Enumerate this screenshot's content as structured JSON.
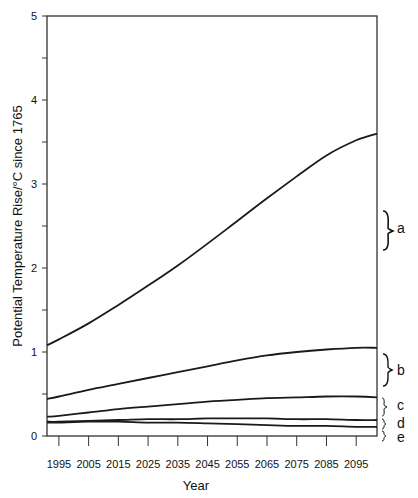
{
  "chart_data": {
    "type": "line",
    "title": "",
    "xlabel": "Year",
    "ylabel": "Potential Temperature Rise/°C since 1765",
    "xlim": [
      1991,
      2102
    ],
    "ylim": [
      0,
      5
    ],
    "yticks": [
      "0",
      "1",
      "2",
      "3",
      "4",
      "5"
    ],
    "xticks": [
      "1995",
      "2005",
      "2015",
      "2025",
      "2035",
      "2045",
      "2055",
      "2065",
      "2075",
      "2085",
      "2095"
    ],
    "grid": false,
    "legend": "right-side brace labels",
    "x": [
      1991,
      1995,
      2005,
      2015,
      2025,
      2035,
      2045,
      2055,
      2065,
      2075,
      2085,
      2095,
      2102
    ],
    "series": [
      {
        "name": "a",
        "values": [
          1.08,
          1.15,
          1.34,
          1.56,
          1.79,
          2.03,
          2.29,
          2.56,
          2.83,
          3.09,
          3.34,
          3.52,
          3.6
        ]
      },
      {
        "name": "b",
        "values": [
          0.44,
          0.47,
          0.55,
          0.62,
          0.69,
          0.76,
          0.83,
          0.9,
          0.96,
          1.0,
          1.03,
          1.05,
          1.05
        ]
      },
      {
        "name": "c",
        "values": [
          0.23,
          0.24,
          0.28,
          0.32,
          0.35,
          0.38,
          0.41,
          0.43,
          0.45,
          0.46,
          0.47,
          0.47,
          0.46
        ]
      },
      {
        "name": "d",
        "values": [
          0.17,
          0.17,
          0.18,
          0.19,
          0.2,
          0.2,
          0.21,
          0.21,
          0.21,
          0.2,
          0.2,
          0.19,
          0.19
        ]
      },
      {
        "name": "e",
        "values": [
          0.16,
          0.16,
          0.17,
          0.17,
          0.16,
          0.16,
          0.15,
          0.14,
          0.13,
          0.12,
          0.12,
          0.11,
          0.11
        ]
      }
    ],
    "annotations": [
      "a",
      "b",
      "c",
      "d",
      "e"
    ]
  },
  "labels": {
    "xlabel": "Year",
    "ylabel": "Potential Temperature Rise/°C since 1765",
    "series_a": "a",
    "series_b": "b",
    "series_c": "c",
    "series_d": "d",
    "series_e": "e"
  },
  "yticks": [
    "0",
    "1",
    "2",
    "3",
    "4",
    "5"
  ],
  "xticks": [
    "1995",
    "2005",
    "2015",
    "2025",
    "2035",
    "2045",
    "2055",
    "2065",
    "2075",
    "2085",
    "2095"
  ],
  "colors": {
    "line": "#1a1a1a",
    "axis": "#333333",
    "background": "#ffffff"
  }
}
